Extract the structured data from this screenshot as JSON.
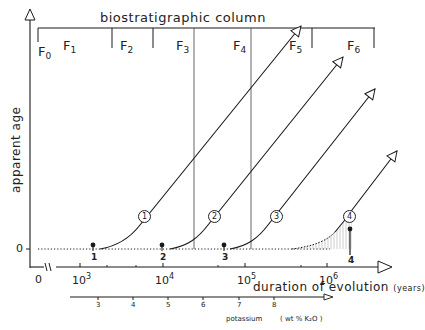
{
  "header": {
    "title": "biostratigraphic column",
    "facies": [
      {
        "label": "F",
        "sub": "0"
      },
      {
        "label": "F",
        "sub": "1"
      },
      {
        "label": "F",
        "sub": "2"
      },
      {
        "label": "F",
        "sub": "3"
      },
      {
        "label": "F",
        "sub": "4"
      },
      {
        "label": "F",
        "sub": "5"
      },
      {
        "label": "F",
        "sub": "6"
      }
    ]
  },
  "y_axis": {
    "title": "apparent age",
    "zero_label": "0"
  },
  "x_axis": {
    "title": "duration of evolution",
    "unit": "(years)",
    "origin_label": "0",
    "break_symbol": "≈",
    "ticks": [
      {
        "base": "10",
        "exp": "3"
      },
      {
        "base": "10",
        "exp": "4"
      },
      {
        "base": "10",
        "exp": "5"
      },
      {
        "base": "10",
        "exp": "6"
      }
    ]
  },
  "potassium_axis": {
    "title": "potassium",
    "unit": "( wt % K₂O )",
    "ticks": [
      "3",
      "4",
      "5",
      "6",
      "7",
      "8"
    ]
  },
  "curves": [
    {
      "id": "1",
      "start_label": "1"
    },
    {
      "id": "2",
      "start_label": "2"
    },
    {
      "id": "3",
      "start_label": "3"
    },
    {
      "id": "4",
      "start_label": "4"
    }
  ],
  "colors": {
    "line": "#1a1a1a",
    "guide": "#555555",
    "hatch": "#999999"
  }
}
